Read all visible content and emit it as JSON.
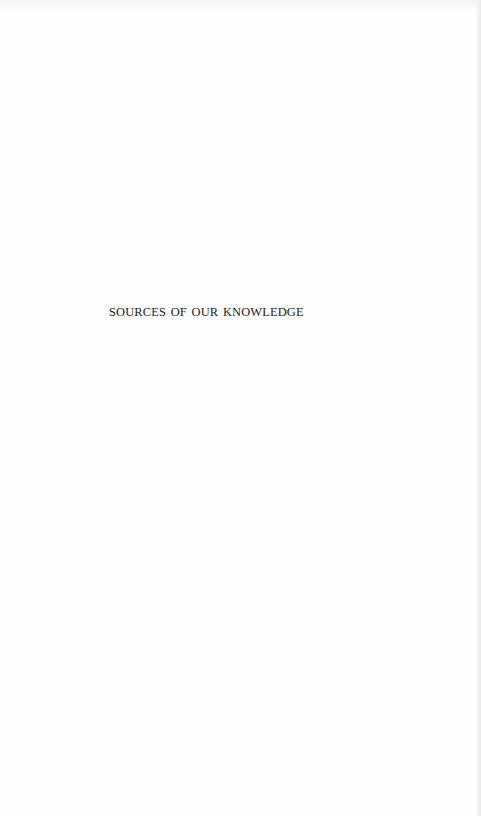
{
  "page": {
    "type": "half-title page",
    "background_color": "#fefefe",
    "text_color": "#1c1c1c"
  },
  "half_title": {
    "text": "SOURCES OF OUR KNOWLEDGE"
  }
}
